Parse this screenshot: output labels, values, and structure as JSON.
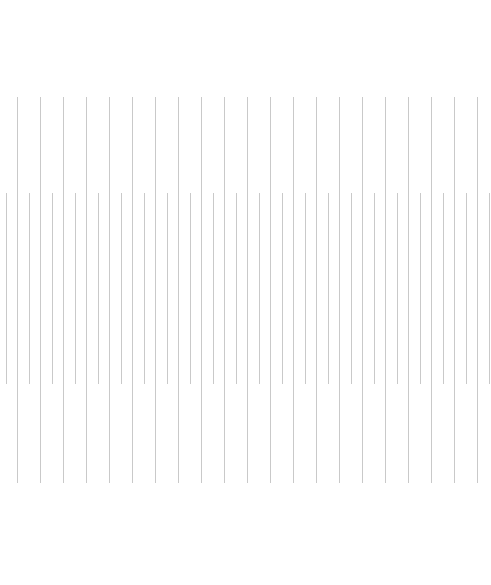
{
  "canvas": {
    "width": 491,
    "height": 585,
    "background": "#ffffff"
  },
  "line_color": "#c9c9c9",
  "band_a": {
    "x_start": 17,
    "spacing": 23,
    "count": 21,
    "y_top": 97,
    "y_bottom": 483
  },
  "band_b": {
    "x_start": 6,
    "spacing": 23,
    "count": 22,
    "y_top": 193,
    "y_bottom": 384
  }
}
